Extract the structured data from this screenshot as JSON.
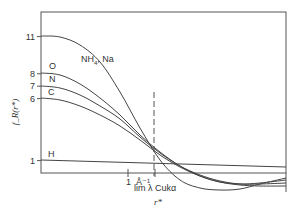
{
  "chart_data": {
    "type": "line",
    "title": "",
    "xlabel": "r*",
    "ylabel": "f_R(r*)",
    "x_annotation": "lim λ Cukα",
    "x_ticks": [
      {
        "label": "1",
        "px": 128
      },
      {
        "label": "Å⁻¹",
        "px": 155
      }
    ],
    "y_ticks": [
      {
        "label": "11",
        "value": 11
      },
      {
        "label": "8",
        "value": 8
      },
      {
        "label": "7",
        "value": 7
      },
      {
        "label": "6",
        "value": 6
      },
      {
        "label": "1",
        "value": 1
      }
    ],
    "ylim": [
      0,
      13
    ],
    "grid": false,
    "dashed_vline": {
      "x_px": 154,
      "label": "lim λ Cukα"
    },
    "series": [
      {
        "name": "NH4, Na",
        "label_main": "NH",
        "label_sub": "4",
        "label_rest": ", Na",
        "start_value": 11,
        "points": [
          [
            41,
            36
          ],
          [
            60,
            37
          ],
          [
            80,
            45
          ],
          [
            100,
            62
          ],
          [
            120,
            92
          ],
          [
            140,
            128
          ],
          [
            160,
            160
          ],
          [
            180,
            180
          ],
          [
            200,
            188
          ],
          [
            220,
            190
          ],
          [
            240,
            189
          ],
          [
            260,
            184
          ],
          [
            286,
            178
          ]
        ]
      },
      {
        "name": "O",
        "label": "O",
        "start_value": 8,
        "points": [
          [
            41,
            73
          ],
          [
            60,
            75
          ],
          [
            80,
            84
          ],
          [
            100,
            98
          ],
          [
            120,
            115
          ],
          [
            140,
            135
          ],
          [
            160,
            152
          ],
          [
            180,
            166
          ],
          [
            200,
            176
          ],
          [
            220,
            182
          ],
          [
            240,
            184
          ],
          [
            260,
            183
          ],
          [
            286,
            180
          ]
        ]
      },
      {
        "name": "N",
        "label": "N",
        "start_value": 7,
        "points": [
          [
            41,
            86
          ],
          [
            60,
            88
          ],
          [
            80,
            95
          ],
          [
            100,
            106
          ],
          [
            120,
            119
          ],
          [
            140,
            137
          ],
          [
            160,
            153
          ],
          [
            180,
            166
          ],
          [
            200,
            175
          ],
          [
            220,
            181
          ],
          [
            240,
            184
          ],
          [
            260,
            184
          ],
          [
            286,
            183
          ]
        ]
      },
      {
        "name": "C",
        "label": "C",
        "start_value": 6,
        "points": [
          [
            41,
            98
          ],
          [
            60,
            100
          ],
          [
            80,
            106
          ],
          [
            100,
            115
          ],
          [
            120,
            126
          ],
          [
            140,
            140
          ],
          [
            160,
            155
          ],
          [
            180,
            167
          ],
          [
            200,
            176
          ],
          [
            220,
            182
          ],
          [
            240,
            185
          ],
          [
            260,
            186
          ],
          [
            286,
            186
          ]
        ]
      },
      {
        "name": "H",
        "label": "H",
        "start_value": 1,
        "points": [
          [
            41,
            160
          ],
          [
            286,
            167
          ]
        ]
      }
    ],
    "legend": "inline labels at left"
  }
}
